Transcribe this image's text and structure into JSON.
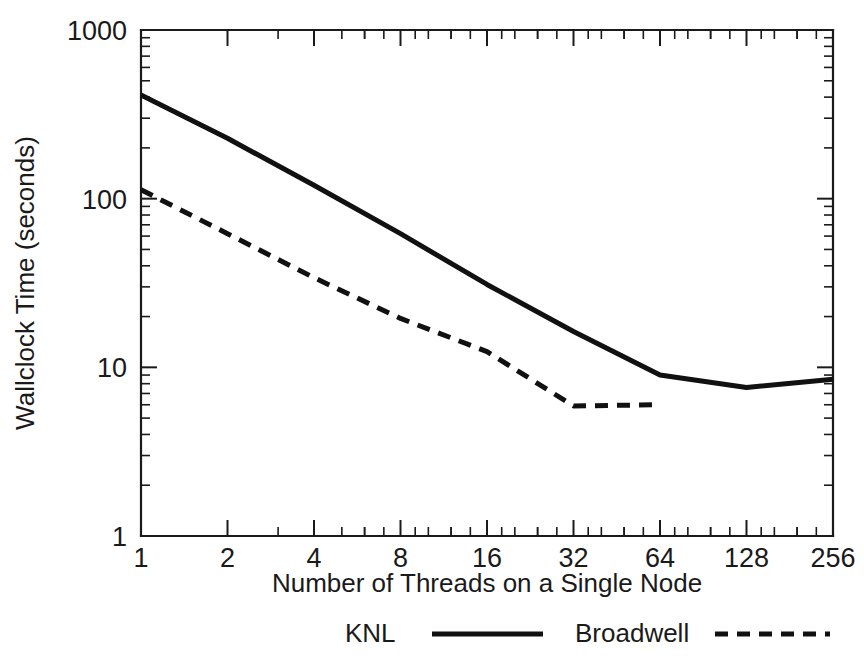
{
  "chart_data": {
    "type": "line",
    "title": "",
    "xlabel": "Number of Threads on a Single Node",
    "ylabel": "Wallclock Time (seconds)",
    "xscale": "log2",
    "yscale": "log10",
    "xlim": [
      1,
      256
    ],
    "ylim": [
      1,
      1000
    ],
    "grid": false,
    "legend_position": "below-axis",
    "x_tick_labels": [
      "1",
      "2",
      "4",
      "8",
      "16",
      "32",
      "64",
      "128",
      "256"
    ],
    "x_tick_values": [
      1,
      2,
      4,
      8,
      16,
      32,
      64,
      128,
      256
    ],
    "y_tick_labels": [
      "1000",
      "100",
      "10",
      "1"
    ],
    "y_tick_values": [
      1000,
      100,
      10,
      1
    ],
    "series": [
      {
        "name": "KNL",
        "style": "solid",
        "color": "#111111",
        "x": [
          1,
          2,
          4,
          8,
          16,
          32,
          64,
          128,
          256
        ],
        "values": [
          412,
          228,
          120,
          62,
          31,
          16.3,
          9.0,
          7.6,
          8.5
        ]
      },
      {
        "name": "Broadwell",
        "style": "dashed",
        "color": "#111111",
        "x": [
          1,
          2,
          4,
          8,
          16,
          32,
          64
        ],
        "values": [
          113,
          62,
          34,
          19.5,
          12.4,
          5.9,
          6.0
        ]
      }
    ]
  },
  "legend": {
    "entries": [
      {
        "label": "KNL",
        "style": "solid"
      },
      {
        "label": "Broadwell",
        "style": "dashed"
      }
    ]
  },
  "axes": {
    "x_axis_title": "Number of Threads on a Single Node",
    "y_axis_title": "Wallclock Time (seconds)"
  }
}
